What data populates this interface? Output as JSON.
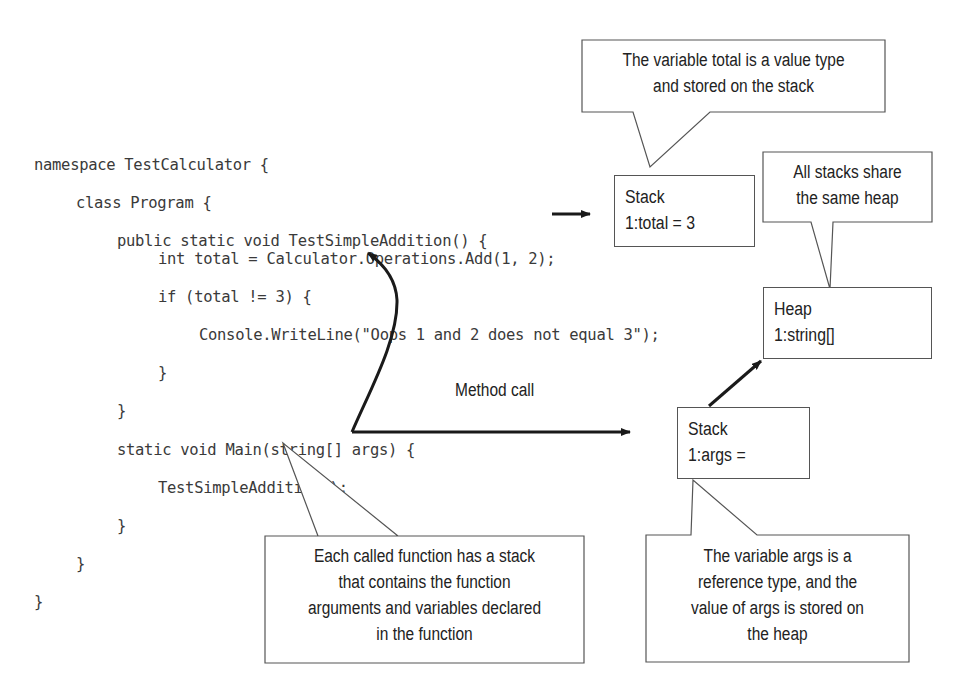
{
  "code": {
    "lines": [
      {
        "indent": 0,
        "text": "namespace TestCalculator {"
      },
      {
        "indent": 1,
        "text": "class Program {"
      },
      {
        "indent": 2,
        "text": "public static void TestSimpleAddition() {"
      },
      {
        "indent": 3,
        "text": "int total = Calculator.Operations.Add(1, 2);"
      },
      {
        "indent": 3,
        "text": "if (total != 3) {"
      },
      {
        "indent": 4,
        "text": "Console.WriteLine(\"Oops 1 and 2 does not equal 3\");"
      },
      {
        "indent": 3,
        "text": "}"
      },
      {
        "indent": 2,
        "text": "}"
      },
      {
        "indent": 2,
        "text": "static void Main(string[] args) {"
      },
      {
        "indent": 3,
        "text": "TestSimpleAddition();"
      },
      {
        "indent": 2,
        "text": "}"
      },
      {
        "indent": 1,
        "text": "}"
      },
      {
        "indent": 0,
        "text": "}"
      }
    ]
  },
  "boxes": {
    "stack_total": {
      "title": "Stack",
      "entry": "1:total = 3"
    },
    "heap": {
      "title": "Heap",
      "entry": "1:string[]"
    },
    "stack_args": {
      "title": "Stack",
      "entry": "1:args ="
    }
  },
  "callouts": {
    "value_type": {
      "lines": [
        "The variable total is a value type",
        "and stored on the stack"
      ]
    },
    "shared_heap": {
      "lines": [
        "All stacks share",
        "the same heap"
      ]
    },
    "function_stack": {
      "lines": [
        "Each called function has a stack",
        "that contains the function",
        "arguments and variables declared",
        "in the function"
      ]
    },
    "reference_type": {
      "lines": [
        "The variable args is a",
        "reference type, and the",
        "value of args is stored on",
        "the heap"
      ]
    }
  },
  "labels": {
    "method_call": "Method call"
  },
  "colors": {
    "code_text": "#3a3a3a",
    "box_border": "#555555",
    "arrow": "#1a1a1a"
  }
}
